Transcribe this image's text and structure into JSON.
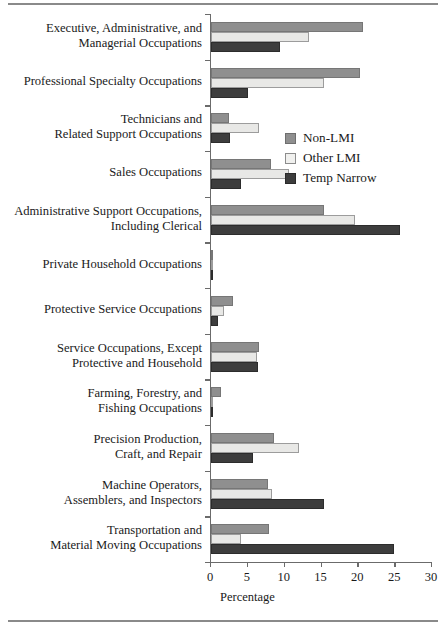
{
  "figure": {
    "has_top_rule": true,
    "has_bottom_rule": true
  },
  "chart_data": {
    "type": "bar",
    "orientation": "horizontal",
    "title": "",
    "xlabel": "Percentage",
    "ylabel": "",
    "xlim": [
      0,
      30
    ],
    "xticks": [
      0,
      5,
      10,
      15,
      20,
      25,
      30
    ],
    "xtick_labels": [
      "0",
      "5",
      "10",
      "15",
      "20",
      "25",
      "30"
    ],
    "grid": false,
    "legend_position": "upper right inside",
    "categories": [
      "Executive, Administrative, and Managerial Occupations",
      "Professional Specialty Occupations",
      "Technicians and Related Support Occupations",
      "Sales Occupations",
      "Administrative Support Occupations, Including Clerical",
      "Private Household Occupations",
      "Protective Service Occupations",
      "Service Occupations, Except Protective and Household",
      "Farming, Forestry, and Fishing Occupations",
      "Precision Production, Craft, and Repair",
      "Machine Operators, Assemblers, and Inspectors",
      "Transportation and Material Moving Occupations"
    ],
    "category_lines": [
      [
        "Executive, Administrative, and",
        "Managerial Occupations"
      ],
      [
        "Professional Specialty Occupations"
      ],
      [
        "Technicians and",
        "Related Support Occupations"
      ],
      [
        "Sales Occupations"
      ],
      [
        "Administrative Support Occupations,",
        "Including Clerical"
      ],
      [
        "Private Household Occupations"
      ],
      [
        "Protective Service Occupations"
      ],
      [
        "Service Occupations, Except",
        "Protective and Household"
      ],
      [
        "Farming, Forestry, and",
        "Fishing Occupations"
      ],
      [
        "Precision Production,",
        "Craft, and Repair"
      ],
      [
        "Machine Operators,",
        "Assemblers, and Inspectors"
      ],
      [
        "Transportation and",
        "Material Moving Occupations"
      ]
    ],
    "series": [
      {
        "name": "Non-LMI",
        "color": "#8f8f8f",
        "values": [
          20.6,
          20.2,
          2.5,
          8.1,
          15.4,
          0.15,
          3.0,
          6.5,
          1.4,
          8.6,
          7.8,
          7.9
        ]
      },
      {
        "name": "Other LMI",
        "color": "#e8e8e6",
        "values": [
          13.3,
          15.4,
          6.5,
          10.6,
          19.5,
          0.2,
          1.8,
          6.2,
          0.3,
          12.0,
          8.3,
          4.1
        ]
      },
      {
        "name": "Temp Narrow",
        "color": "#3d3d3d",
        "values": [
          9.3,
          5.0,
          2.6,
          4.1,
          25.6,
          0.1,
          1.0,
          6.4,
          0.1,
          5.7,
          15.4,
          24.8
        ]
      }
    ]
  },
  "legend": {
    "items": [
      {
        "label": "Non-LMI"
      },
      {
        "label": "Other LMI"
      },
      {
        "label": "Temp Narrow"
      }
    ]
  }
}
